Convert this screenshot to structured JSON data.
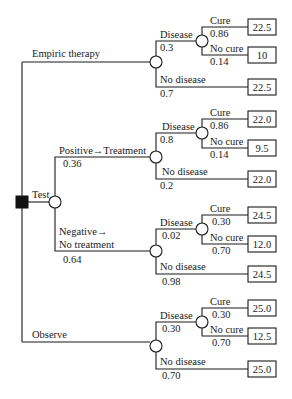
{
  "tree": {
    "root": {
      "type": "decision",
      "label": ""
    },
    "strategies": [
      {
        "label": "Empiric therapy",
        "disease": {
          "label": "Disease",
          "p": "0.3",
          "cure": {
            "label": "Cure",
            "p": "0.86",
            "value": "22.5"
          },
          "nocure": {
            "label": "No cure",
            "p": "0.14",
            "value": "10"
          }
        },
        "nodisease": {
          "label": "No disease",
          "p": "0.7",
          "value": "22.5"
        }
      },
      {
        "label": "Test",
        "positive": {
          "label": "Positive→Treatment",
          "p": "0.36",
          "disease": {
            "label": "Disease",
            "p": "0.8",
            "cure": {
              "label": "Cure",
              "p": "0.86",
              "value": "22.0"
            },
            "nocure": {
              "label": "No cure",
              "p": "0.14",
              "value": "9.5"
            }
          },
          "nodisease": {
            "label": "No disease",
            "p": "0.2",
            "value": "22.0"
          }
        },
        "negative": {
          "label1": "Negative→",
          "label2": "No treatment",
          "p": "0.64",
          "disease": {
            "label": "Disease",
            "p": "0.02",
            "cure": {
              "label": "Cure",
              "p": "0.30",
              "value": "24.5"
            },
            "nocure": {
              "label": "No cure",
              "p": "0.70",
              "value": "12.0"
            }
          },
          "nodisease": {
            "label": "No disease",
            "p": "0.98",
            "value": "24.5"
          }
        }
      },
      {
        "label": "Observe",
        "disease": {
          "label": "Disease",
          "p": "0.30",
          "cure": {
            "label": "Cure",
            "p": "0.30",
            "value": "25.0"
          },
          "nocure": {
            "label": "No cure",
            "p": "0.70",
            "value": "12.5"
          }
        },
        "nodisease": {
          "label": "No disease",
          "p": "0.70",
          "value": "25.0"
        }
      }
    ]
  }
}
